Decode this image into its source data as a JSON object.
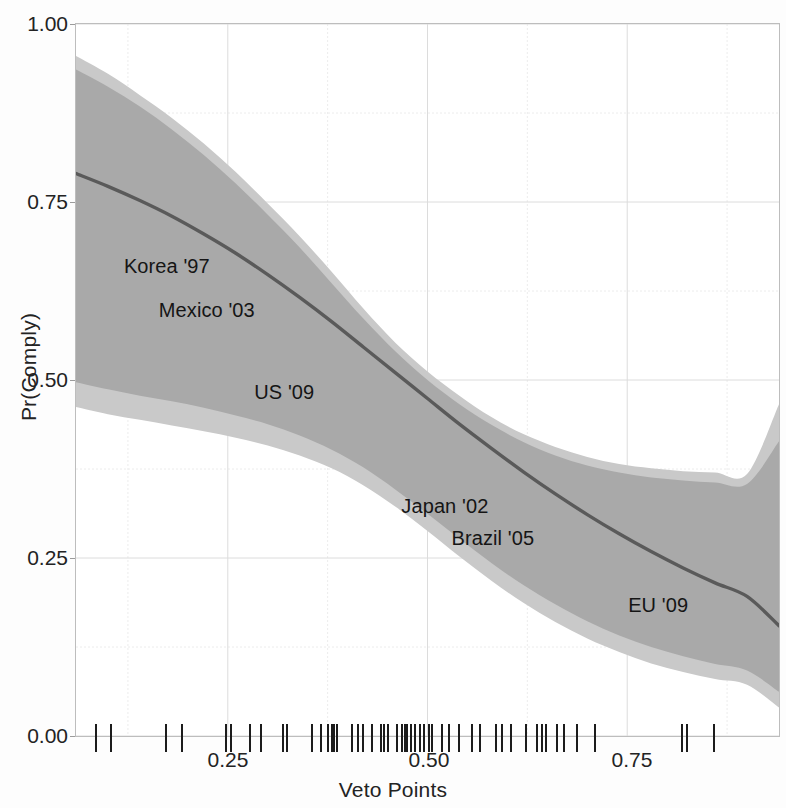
{
  "chart_data": {
    "type": "line",
    "title": "",
    "xlabel": "Veto Points",
    "ylabel": "Pr(Comply)",
    "xlim": [
      0.06,
      0.94
    ],
    "ylim": [
      0.0,
      1.0
    ],
    "grid": true,
    "legend": "none",
    "xticks": [
      "0.25",
      "0.50",
      "0.75"
    ],
    "xtick_values": [
      0.25,
      0.5,
      0.75
    ],
    "yticks": [
      "0.00",
      "0.25",
      "0.50",
      "0.75",
      "1.00"
    ],
    "ytick_values": [
      0.0,
      0.25,
      0.5,
      0.75,
      1.0
    ],
    "series": [
      {
        "name": "Predicted Pr(Comply)",
        "color": "#5a5a5a",
        "x": [
          0.06,
          0.1,
          0.14,
          0.18,
          0.22,
          0.26,
          0.3,
          0.34,
          0.38,
          0.42,
          0.46,
          0.5,
          0.54,
          0.58,
          0.62,
          0.66,
          0.7,
          0.74,
          0.78,
          0.82,
          0.86,
          0.9,
          0.94
        ],
        "y": [
          0.79,
          0.772,
          0.752,
          0.73,
          0.705,
          0.678,
          0.648,
          0.616,
          0.582,
          0.546,
          0.51,
          0.474,
          0.438,
          0.404,
          0.371,
          0.34,
          0.311,
          0.284,
          0.259,
          0.236,
          0.215,
          0.196,
          0.155
        ]
      }
    ],
    "bands": [
      {
        "name": "outer confidence band",
        "color": "#c9c9c9",
        "x": [
          0.06,
          0.1,
          0.14,
          0.18,
          0.22,
          0.26,
          0.3,
          0.34,
          0.38,
          0.42,
          0.46,
          0.5,
          0.54,
          0.58,
          0.62,
          0.66,
          0.7,
          0.74,
          0.78,
          0.82,
          0.86,
          0.9,
          0.94
        ],
        "upper": [
          0.955,
          0.93,
          0.9,
          0.868,
          0.832,
          0.792,
          0.748,
          0.702,
          0.652,
          0.6,
          0.552,
          0.512,
          0.478,
          0.448,
          0.424,
          0.406,
          0.392,
          0.382,
          0.376,
          0.372,
          0.37,
          0.368,
          0.466
        ],
        "lower": [
          0.462,
          0.452,
          0.444,
          0.436,
          0.428,
          0.419,
          0.408,
          0.394,
          0.376,
          0.352,
          0.322,
          0.288,
          0.252,
          0.218,
          0.187,
          0.16,
          0.137,
          0.118,
          0.102,
          0.09,
          0.08,
          0.072,
          0.04
        ]
      },
      {
        "name": "inner confidence band",
        "color": "#a9a9a9",
        "x": [
          0.06,
          0.1,
          0.14,
          0.18,
          0.22,
          0.26,
          0.3,
          0.34,
          0.38,
          0.42,
          0.46,
          0.5,
          0.54,
          0.58,
          0.62,
          0.66,
          0.7,
          0.74,
          0.78,
          0.82,
          0.86,
          0.9,
          0.94
        ],
        "upper": [
          0.936,
          0.912,
          0.884,
          0.852,
          0.816,
          0.776,
          0.732,
          0.686,
          0.636,
          0.586,
          0.54,
          0.5,
          0.466,
          0.437,
          0.413,
          0.394,
          0.38,
          0.37,
          0.363,
          0.359,
          0.356,
          0.354,
          0.414
        ],
        "lower": [
          0.497,
          0.487,
          0.478,
          0.47,
          0.461,
          0.45,
          0.438,
          0.422,
          0.402,
          0.377,
          0.346,
          0.312,
          0.277,
          0.243,
          0.212,
          0.185,
          0.161,
          0.141,
          0.125,
          0.112,
          0.101,
          0.092,
          0.062
        ]
      }
    ],
    "annotations": [
      {
        "label": "Korea '97",
        "x": 0.175,
        "y": 0.655
      },
      {
        "label": "Mexico '03",
        "x": 0.225,
        "y": 0.592
      },
      {
        "label": "US '09",
        "x": 0.322,
        "y": 0.477
      },
      {
        "label": "Japan '02",
        "x": 0.523,
        "y": 0.318
      },
      {
        "label": "Brazil '05",
        "x": 0.583,
        "y": 0.272
      },
      {
        "label": "EU '09",
        "x": 0.79,
        "y": 0.178
      }
    ],
    "rug": {
      "name": "veto-points-observations",
      "axis": "x",
      "y": 0.0,
      "count": 53,
      "values": [
        0.0845,
        0.1035,
        0.193,
        0.248,
        0.2545,
        0.2775,
        0.3185,
        0.324,
        0.3555,
        0.366,
        0.376,
        0.38,
        0.3835,
        0.387,
        0.406,
        0.4135,
        0.4195,
        0.43,
        0.4415,
        0.4455,
        0.45,
        0.462,
        0.468,
        0.4745,
        0.4795,
        0.484,
        0.49,
        0.4955,
        0.5015,
        0.506,
        0.5175,
        0.527,
        0.556,
        0.5855,
        0.5935,
        0.6235,
        0.6375,
        0.643,
        0.648,
        0.6705,
        0.6875,
        0.8185,
        0.8245,
        0.859,
        0.172,
        0.292,
        0.405,
        0.472,
        0.539,
        0.604,
        0.662,
        0.709,
        0.566
      ]
    }
  }
}
